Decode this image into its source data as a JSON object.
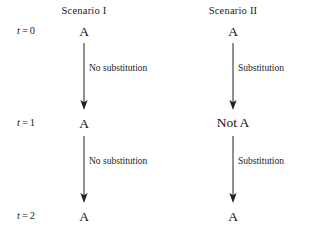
{
  "figure": {
    "columns": [
      {
        "header": "Scenario I"
      },
      {
        "header": "Scenario II"
      }
    ],
    "time_rows": [
      {
        "var": "t",
        "eq": "=",
        "num": "0"
      },
      {
        "var": "t",
        "eq": "=",
        "num": "1"
      },
      {
        "var": "t",
        "eq": "=",
        "num": "2"
      }
    ],
    "nodes": {
      "s1_t0": "A",
      "s1_t1": "A",
      "s1_t2": "A",
      "s2_t0": "A",
      "s2_t1": "Not A",
      "s2_t2": "A"
    },
    "edges": {
      "s1_e1": "No substitution",
      "s1_e2": "No substitution",
      "s2_e1": "Substitution",
      "s2_e2": "Substitution"
    },
    "colors": {
      "ink": "#1a1a1a",
      "arrow": "#222222",
      "background": "#ffffff"
    }
  }
}
